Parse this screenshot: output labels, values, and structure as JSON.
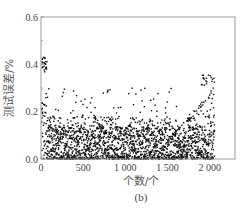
{
  "chart_data": {
    "type": "scatter",
    "title": "",
    "caption": "(b)",
    "xlabel": "个数/个",
    "ylabel": "测试误差/%",
    "xlim": [
      0,
      2300
    ],
    "ylim": [
      0.0,
      0.6
    ],
    "x_ticks": [
      0,
      500,
      1000,
      1500,
      2000
    ],
    "x_tick_labels": [
      "0",
      "500",
      "1 000",
      "1 500",
      "2 000"
    ],
    "y_ticks": [
      0.0,
      0.2,
      0.4,
      0.6
    ],
    "y_tick_labels": [
      "0.0",
      "0.2",
      "0.4",
      "0.6"
    ],
    "grid": false,
    "legend": null,
    "n_points": 2100,
    "point_color": "#111111",
    "segments": [
      {
        "x_range": [
          0,
          60
        ],
        "y_max": 0.43,
        "note": "initial high cluster 0.38-0.43"
      },
      {
        "x_range": [
          60,
          1600
        ],
        "y_max": 0.3,
        "typical_max": 0.15
      },
      {
        "x_range": [
          1600,
          2050
        ],
        "y_max": 0.36,
        "note": "rising trend, upper cluster 0.32-0.36 near x≈1900-2050"
      }
    ]
  }
}
